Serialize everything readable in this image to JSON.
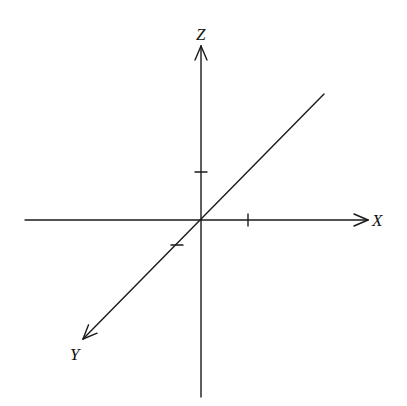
{
  "diagram": {
    "type": "3d-coordinate-axes",
    "stroke_color": "#1a1a1a",
    "background": "#ffffff",
    "origin": {
      "x": 201,
      "y": 220
    },
    "axes": [
      {
        "name": "X",
        "label": "X",
        "from": {
          "x": 25,
          "y": 220
        },
        "to": {
          "x": 368,
          "y": 220
        },
        "arrow": true,
        "label_pos": {
          "x": 372,
          "y": 226
        },
        "tick": {
          "x": 248,
          "y": 220,
          "orient": "vertical"
        }
      },
      {
        "name": "Z",
        "label": "Z",
        "from": {
          "x": 201,
          "y": 397
        },
        "to": {
          "x": 201,
          "y": 46
        },
        "arrow": true,
        "label_pos": {
          "x": 196,
          "y": 40
        },
        "tick": {
          "x": 201,
          "y": 172,
          "orient": "horizontal"
        }
      },
      {
        "name": "Y",
        "label": "Y",
        "from": {
          "x": 324,
          "y": 94
        },
        "to": {
          "x": 83,
          "y": 339
        },
        "arrow": true,
        "label_pos": {
          "x": 70,
          "y": 360
        },
        "tick": {
          "x": 177,
          "y": 245,
          "orient": "horizontal"
        }
      }
    ]
  }
}
